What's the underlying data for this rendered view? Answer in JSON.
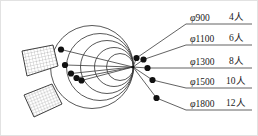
{
  "figure": {
    "background_color": "#ffffff",
    "line_color": "#2b2b2b",
    "faint_border_color": "#d9d9d9",
    "dot_color": "#111111"
  },
  "legend": {
    "rows": [
      {
        "id": "row-900",
        "phi": "φ",
        "diameter": "900",
        "count": "4",
        "unit": "人",
        "count_label": "4人",
        "full": "φ900  4人"
      },
      {
        "id": "row-1100",
        "phi": "φ",
        "diameter": "1100",
        "count": "6",
        "unit": "人",
        "count_label": "6人",
        "full": "φ1100  6人"
      },
      {
        "id": "row-1300",
        "phi": "φ",
        "diameter": "1300",
        "count": "8",
        "unit": "人",
        "count_label": "8人",
        "full": "φ1300  8人"
      },
      {
        "id": "row-1500",
        "phi": "φ",
        "diameter": "1500",
        "count": "10",
        "unit": "人",
        "count_label": "10人",
        "full": "φ1500  10人"
      },
      {
        "id": "row-1800",
        "phi": "φ",
        "diameter": "1800",
        "count": "12",
        "unit": "人",
        "count_label": "12人",
        "full": "φ1800  12人"
      }
    ]
  },
  "diagram": {
    "apex": {
      "x": 133,
      "y": 67
    },
    "circles": [
      {
        "ref": "900",
        "cx": 120.0,
        "cy": 67,
        "r": 13.5
      },
      {
        "ref": "1100",
        "cx": 114.0,
        "cy": 67,
        "r": 19.5
      },
      {
        "ref": "1300",
        "cx": 107.0,
        "cy": 67,
        "r": 26.5
      },
      {
        "ref": "1500",
        "cx": 100.0,
        "cy": 67,
        "r": 33.5
      },
      {
        "ref": "1800",
        "cx": 92.0,
        "cy": 67,
        "r": 41.5
      }
    ],
    "left_dots": [
      {
        "ref": "900",
        "x": 81.5,
        "y": 80.5
      },
      {
        "ref": "1100",
        "x": 76.5,
        "y": 78.0
      },
      {
        "ref": "1300",
        "x": 71.0,
        "y": 73.5
      },
      {
        "ref": "1500",
        "x": 65.0,
        "y": 65.0
      },
      {
        "ref": "1800",
        "x": 61.0,
        "y": 49.5
      }
    ],
    "right_dots": [
      {
        "ref": "900",
        "x": 136.5,
        "y": 58.0
      },
      {
        "ref": "1100",
        "x": 143.5,
        "y": 59.5
      },
      {
        "ref": "1300",
        "x": 147.5,
        "y": 68.0
      },
      {
        "ref": "1500",
        "x": 152.5,
        "y": 80.0
      },
      {
        "ref": "1800",
        "x": 156.5,
        "y": 98.0
      }
    ],
    "hatched_panels": [
      {
        "id": "panel-upper",
        "points": "22,51 53,45 58,66 27,76"
      },
      {
        "id": "panel-lower",
        "points": "24,95 52,84 62,104 34,117"
      }
    ]
  }
}
